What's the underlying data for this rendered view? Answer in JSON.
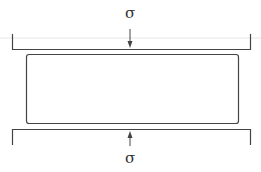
{
  "diagram": {
    "type": "uniaxial-compression",
    "top_label": "σ",
    "bottom_label": "σ",
    "colors": {
      "stroke": "#444444",
      "background": "#ffffff",
      "guide": "#dddddd"
    }
  }
}
